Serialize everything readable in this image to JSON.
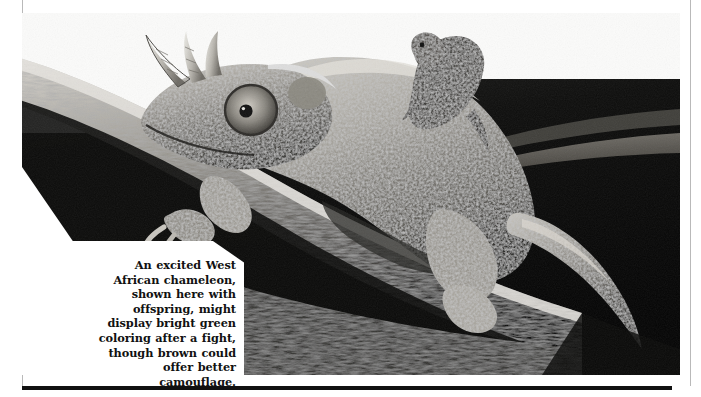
{
  "page": {
    "kind": "scanned-magazine-page",
    "background_color": "#ffffff",
    "rule_color": "#111111",
    "gutter_rule_color": "#b9b9b9"
  },
  "photo": {
    "subject": "Jackson's / West African chameleon with offspring on its back, perched on a branch",
    "rendering": "black-and-white halftone photograph",
    "alt": "An adult three-horned chameleon gripping a thick branch, a small juvenile chameleon riding on its shoulders, against a dark background",
    "tones": {
      "highlight": "#f2f1ee",
      "midtone": "#8e8c86",
      "shadow": "#1b1b1b",
      "background_dark": "#060606"
    }
  },
  "caption": {
    "text": "An excited West African chameleon, shown here with offspring, might display bright green coloring after a fight, though brown could offer better camouflage.",
    "align": "right"
  }
}
